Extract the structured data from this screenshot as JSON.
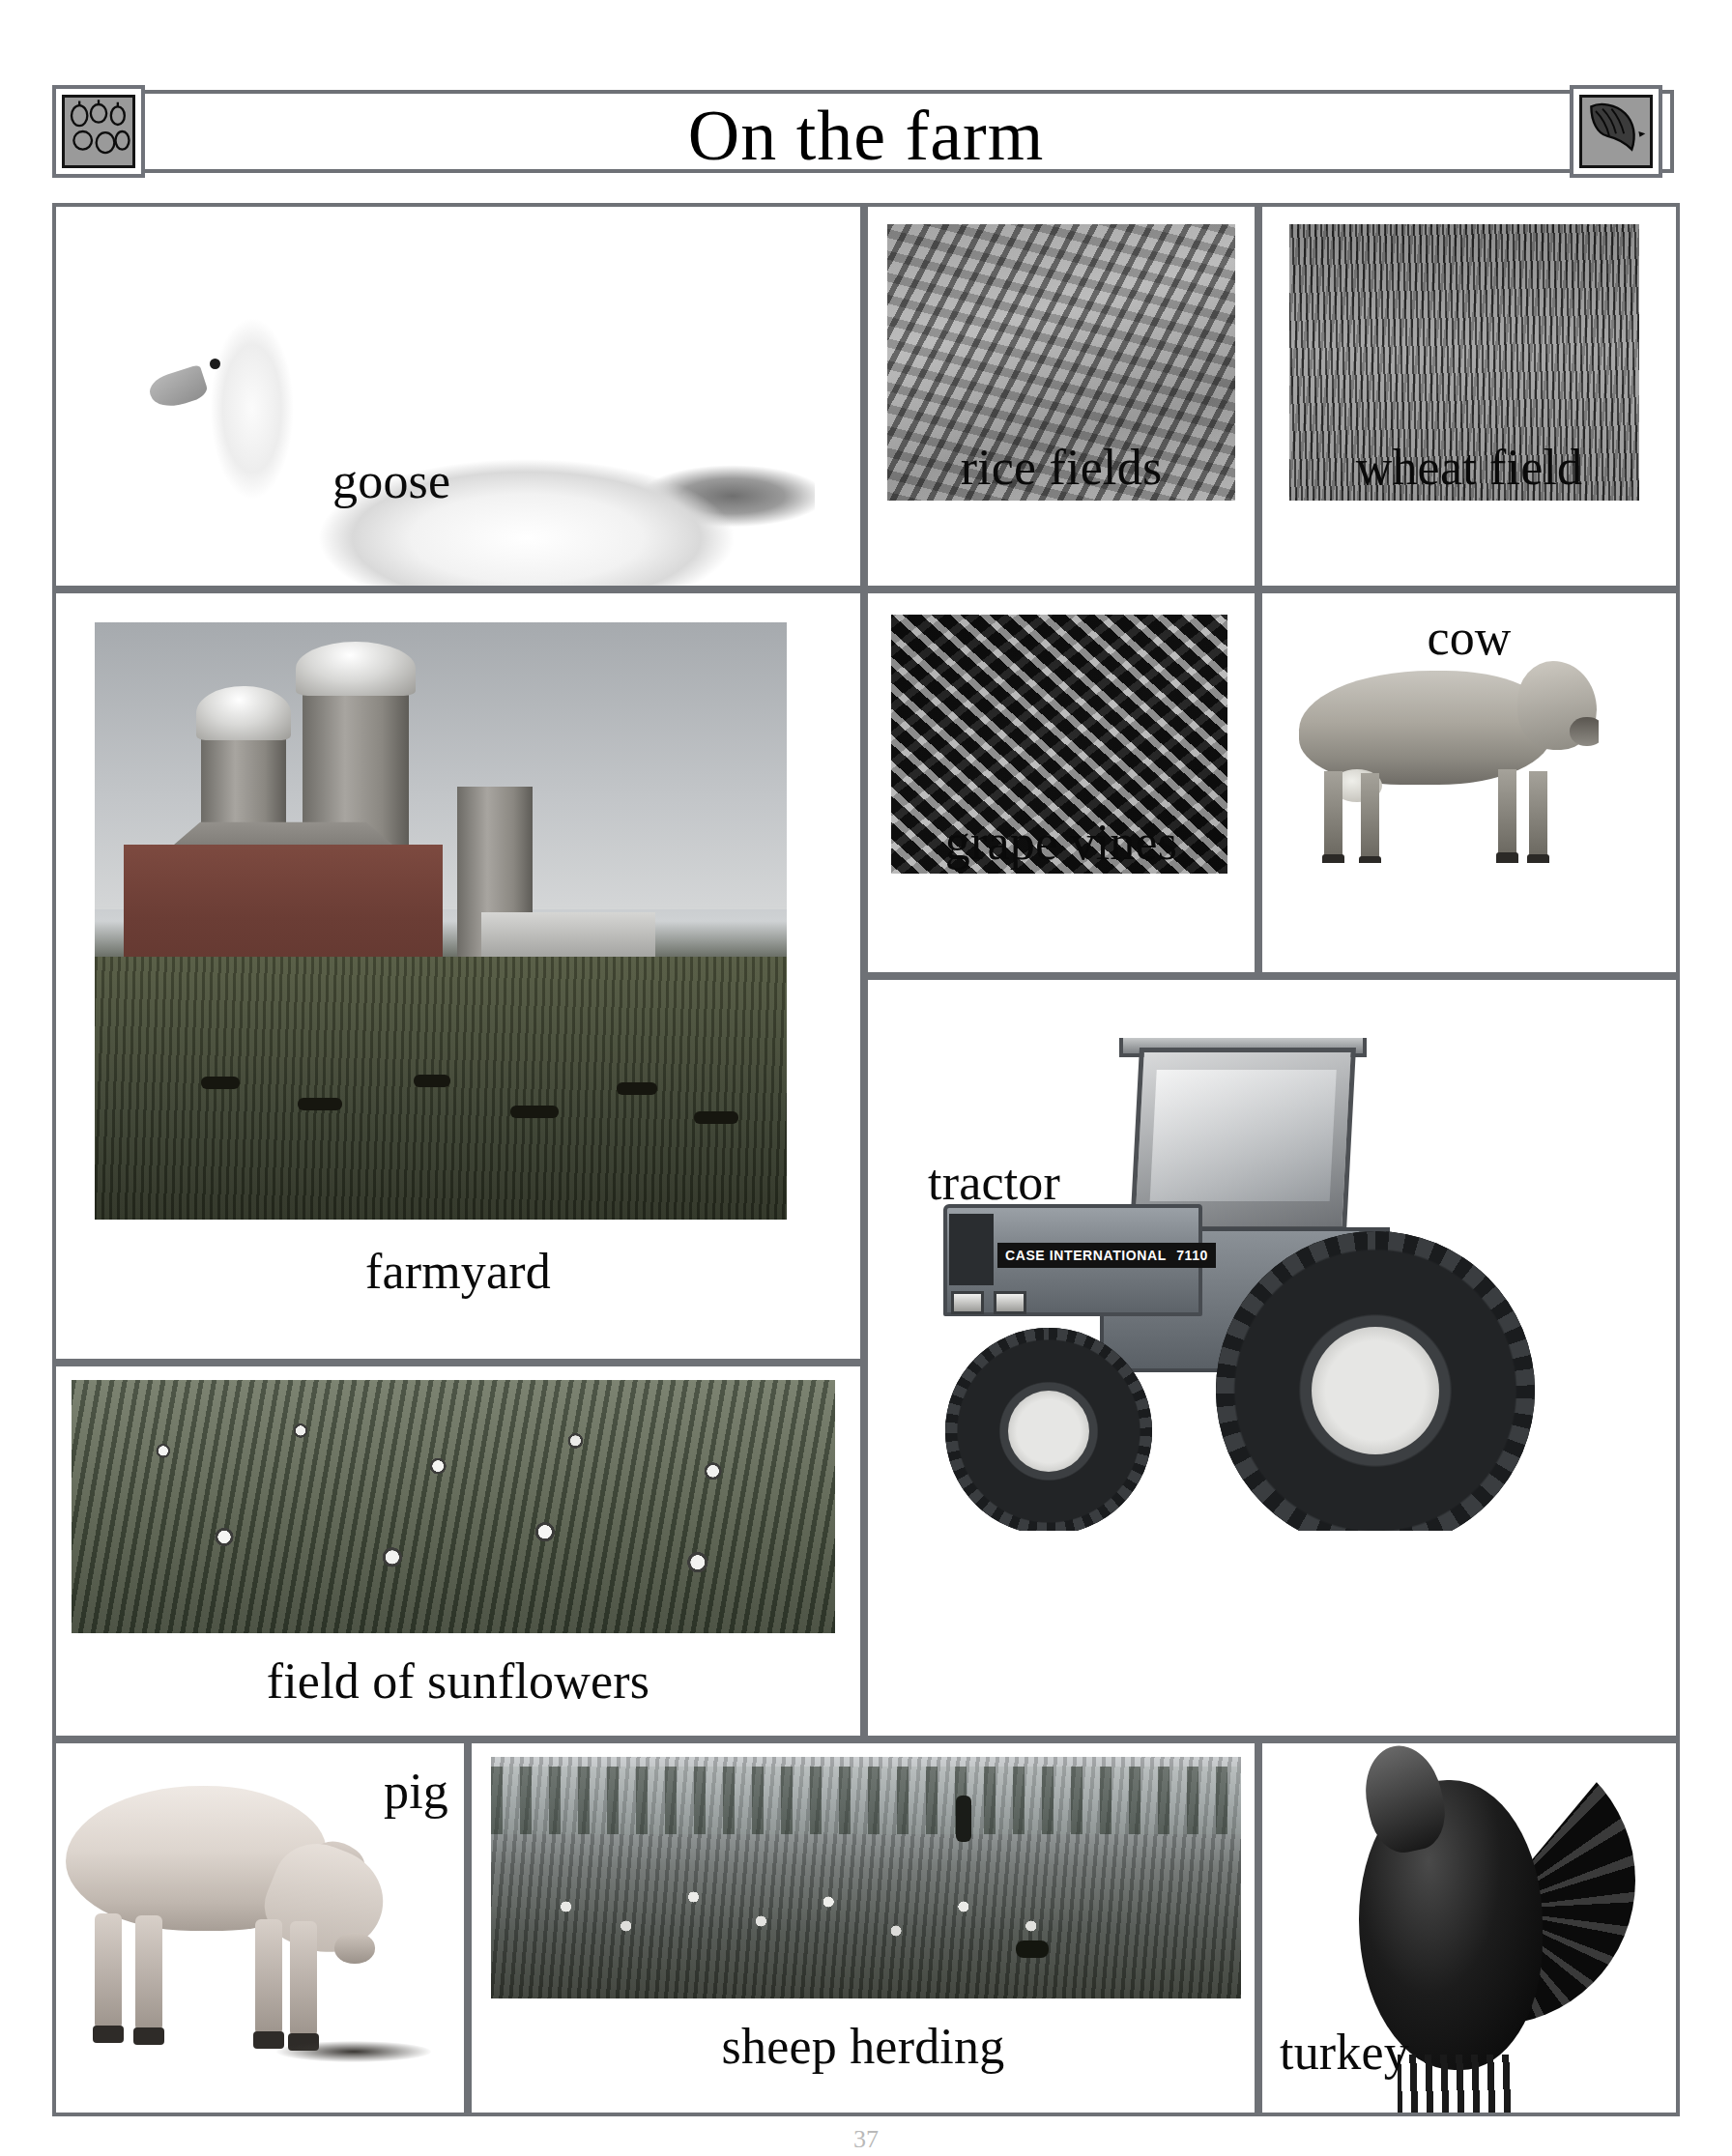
{
  "header": {
    "title": "On the farm",
    "left_icon": "chicks-icon",
    "right_icon": "horse-head-icon"
  },
  "theme": {
    "border_color": "#6e7176",
    "page_background": "#ffffff",
    "label_color": "#0a0a0a"
  },
  "cells": {
    "goose": {
      "label": "goose",
      "image": "goose-photo"
    },
    "rice_fields": {
      "label": "rice fields",
      "image": "rice-fields-photo"
    },
    "wheat_field": {
      "label": "wheat field",
      "image": "wheat-field-photo"
    },
    "farmyard": {
      "label": "farmyard",
      "image": "farmyard-photo"
    },
    "grape_vines": {
      "label": "grape vines",
      "image": "grape-vines-photo"
    },
    "cow": {
      "label": "cow",
      "image": "cow-photo"
    },
    "tractor": {
      "label": "tractor",
      "image": "tractor-photo"
    },
    "sunflowers": {
      "label": "field of sunflowers",
      "image": "sunflower-field-photo"
    },
    "pig": {
      "label": "pig",
      "image": "pig-photo"
    },
    "sheep_herding": {
      "label": "sheep herding",
      "image": "sheep-herding-photo"
    },
    "turkey": {
      "label": "turkey",
      "image": "turkey-photo"
    }
  },
  "tractor_decal": {
    "brand": "CASE INTERNATIONAL",
    "model": "7110"
  },
  "footer": {
    "page_number": "37"
  }
}
